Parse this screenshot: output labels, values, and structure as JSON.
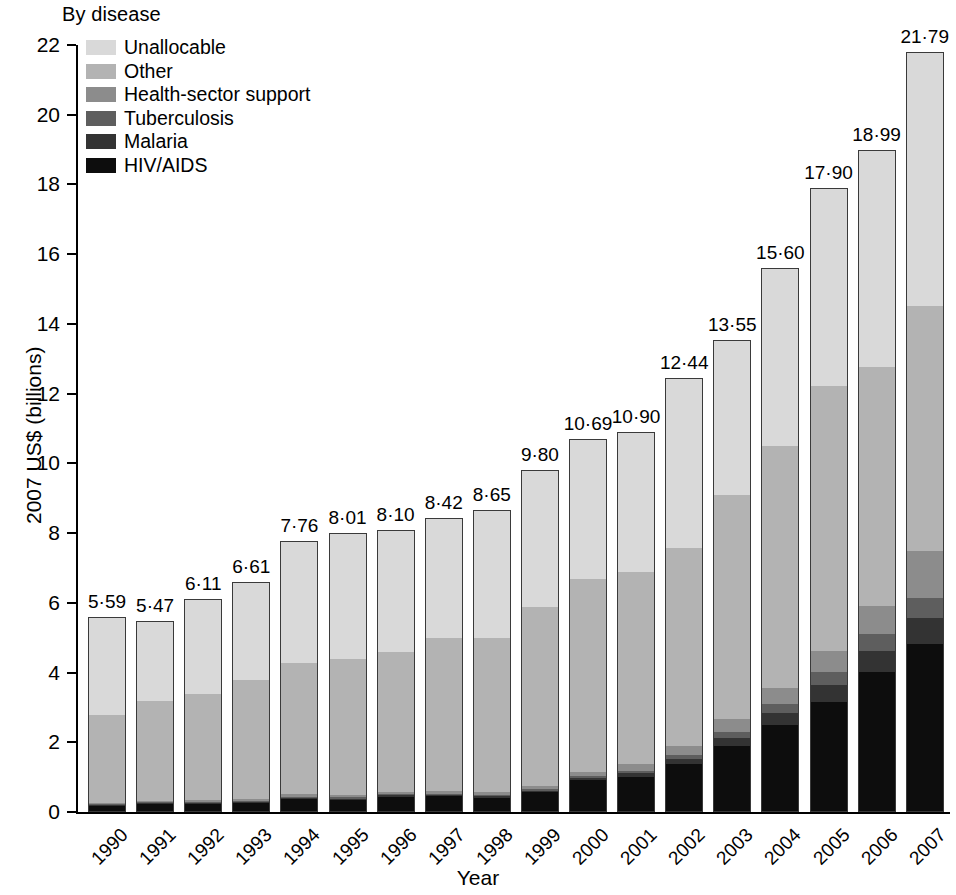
{
  "legend": {
    "title": "By disease",
    "items": [
      {
        "label": "Unallocable",
        "color": "#d9d9d9"
      },
      {
        "label": "Other",
        "color": "#b3b3b3"
      },
      {
        "label": "Health-sector support",
        "color": "#8c8c8c"
      },
      {
        "label": "Tuberculosis",
        "color": "#5e5e5e"
      },
      {
        "label": "Malaria",
        "color": "#333333"
      },
      {
        "label": "HIV/AIDS",
        "color": "#0d0d0d"
      }
    ]
  },
  "chart_data": {
    "type": "bar",
    "subtype": "stacked-bar",
    "title": "",
    "xlabel": "Year",
    "ylabel": "2007 US$ (billions)",
    "ylim": [
      0,
      22
    ],
    "yticks": [
      0,
      2,
      4,
      6,
      8,
      10,
      12,
      14,
      16,
      18,
      20,
      22
    ],
    "ytick_labels": [
      "0",
      "2",
      "4",
      "6",
      "8",
      "10",
      "12",
      "14",
      "16",
      "18",
      "20",
      "22"
    ],
    "grid": false,
    "legend_position": "top-left",
    "decimal_separator": "·",
    "categories": [
      "1990",
      "1991",
      "1992",
      "1993",
      "1994",
      "1995",
      "1996",
      "1997",
      "1998",
      "1999",
      "2000",
      "2001",
      "2002",
      "2003",
      "2004",
      "2005",
      "2006",
      "2007"
    ],
    "series": [
      {
        "name": "HIV/AIDS",
        "color": "#0d0d0d",
        "values": [
          0.18,
          0.24,
          0.25,
          0.28,
          0.38,
          0.36,
          0.45,
          0.46,
          0.42,
          0.58,
          0.92,
          1.02,
          1.4,
          1.92,
          2.52,
          3.18,
          4.02,
          4.82
        ]
      },
      {
        "name": "Malaria",
        "color": "#333333",
        "values": [
          0.03,
          0.03,
          0.03,
          0.03,
          0.04,
          0.04,
          0.04,
          0.04,
          0.04,
          0.05,
          0.07,
          0.1,
          0.14,
          0.22,
          0.32,
          0.48,
          0.62,
          0.76
        ]
      },
      {
        "name": "Tuberculosis",
        "color": "#5e5e5e",
        "values": [
          0.02,
          0.02,
          0.02,
          0.02,
          0.03,
          0.03,
          0.03,
          0.03,
          0.03,
          0.04,
          0.05,
          0.08,
          0.12,
          0.18,
          0.26,
          0.36,
          0.48,
          0.58
        ]
      },
      {
        "name": "Health-sector support",
        "color": "#8c8c8c",
        "values": [
          0.05,
          0.05,
          0.05,
          0.06,
          0.08,
          0.08,
          0.08,
          0.09,
          0.09,
          0.1,
          0.12,
          0.18,
          0.26,
          0.36,
          0.46,
          0.62,
          0.8,
          1.34
        ]
      },
      {
        "name": "Other",
        "color": "#b3b3b3",
        "values": [
          2.52,
          2.86,
          3.04,
          3.41,
          3.77,
          3.89,
          4.0,
          4.38,
          4.42,
          5.13,
          5.53,
          5.52,
          5.68,
          6.42,
          6.96,
          7.58,
          6.86,
          7.02
        ]
      },
      {
        "name": "Unallocable",
        "color": "#d9d9d9",
        "values": [
          2.79,
          2.27,
          2.72,
          2.81,
          3.46,
          3.61,
          3.5,
          3.42,
          3.65,
          3.9,
          4.0,
          4.0,
          4.84,
          4.45,
          5.08,
          5.68,
          6.21,
          7.27
        ]
      }
    ],
    "totals": [
      5.59,
      5.47,
      6.11,
      6.61,
      7.76,
      8.01,
      8.1,
      8.42,
      8.65,
      9.8,
      10.69,
      10.9,
      12.44,
      13.55,
      15.6,
      17.9,
      18.99,
      21.79
    ],
    "total_labels": [
      "5·59",
      "5·47",
      "6·11",
      "6·61",
      "7·76",
      "8·01",
      "8·10",
      "8·42",
      "8·65",
      "9·80",
      "10·69",
      "10·90",
      "12·44",
      "13·55",
      "15·60",
      "17·90",
      "18·99",
      "21·79"
    ]
  }
}
